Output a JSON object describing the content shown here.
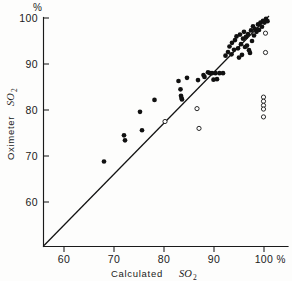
{
  "chart_data": {
    "type": "scatter",
    "title": "",
    "xlabel": "Calculated SO2",
    "xlabel_main": "Calculated",
    "xlabel_symbol": "SO",
    "xlabel_subscript": "2",
    "ylabel": "Oximeter SO2",
    "ylabel_main": "Oximeter",
    "ylabel_symbol": "SO",
    "ylabel_subscript": "2",
    "x_unit_label": "%",
    "y_unit_label": "%",
    "xlim": [
      55.8,
      102.5
    ],
    "ylim": [
      55.5,
      100.8
    ],
    "xticks": [
      60,
      70,
      80,
      90,
      100
    ],
    "xtick_labels": [
      "60",
      "70",
      "80",
      "90",
      "100"
    ],
    "yticks": [
      60,
      70,
      80,
      90,
      100
    ],
    "ytick_labels": [
      "60",
      "70",
      "80",
      "90",
      "100"
    ],
    "grid": false,
    "legend": false,
    "reference_line": {
      "name": "line-of-identity",
      "type": "identity",
      "from": [
        55.8,
        55.5
      ],
      "to": [
        101.0,
        100.4
      ]
    },
    "series": [
      {
        "name": "agreement-points",
        "marker": "filled-circle",
        "color": "#111111",
        "points": [
          [
            68.0,
            68.8
          ],
          [
            72.0,
            74.5
          ],
          [
            72.2,
            73.4
          ],
          [
            75.2,
            79.6
          ],
          [
            75.6,
            75.6
          ],
          [
            78.1,
            82.2
          ],
          [
            82.9,
            86.3
          ],
          [
            83.3,
            84.5
          ],
          [
            83.4,
            83.1
          ],
          [
            83.5,
            82.6
          ],
          [
            83.6,
            82.3
          ],
          [
            84.6,
            87.0
          ],
          [
            86.8,
            86.5
          ],
          [
            87.9,
            87.6
          ],
          [
            88.1,
            87.2
          ],
          [
            88.8,
            88.2
          ],
          [
            89.2,
            88.0
          ],
          [
            89.6,
            88.0
          ],
          [
            89.9,
            86.6
          ],
          [
            90.3,
            88.0
          ],
          [
            90.6,
            86.7
          ],
          [
            91.1,
            88.0
          ],
          [
            91.8,
            88.0
          ],
          [
            92.3,
            91.8
          ],
          [
            92.8,
            92.6
          ],
          [
            93.1,
            93.8
          ],
          [
            93.5,
            92.1
          ],
          [
            93.6,
            94.6
          ],
          [
            94.0,
            93.1
          ],
          [
            94.2,
            95.2
          ],
          [
            94.5,
            96.0
          ],
          [
            94.8,
            93.4
          ],
          [
            95.0,
            91.4
          ],
          [
            95.2,
            96.4
          ],
          [
            95.4,
            94.3
          ],
          [
            95.6,
            92.0
          ],
          [
            95.8,
            95.5
          ],
          [
            96.0,
            97.0
          ],
          [
            96.2,
            93.7
          ],
          [
            96.4,
            95.9
          ],
          [
            96.6,
            94.0
          ],
          [
            96.8,
            96.5
          ],
          [
            97.0,
            93.0
          ],
          [
            97.2,
            92.4
          ],
          [
            97.4,
            97.3
          ],
          [
            97.6,
            95.0
          ],
          [
            97.8,
            98.2
          ],
          [
            98.0,
            96.2
          ],
          [
            98.2,
            97.6
          ],
          [
            98.5,
            97.0
          ],
          [
            98.8,
            98.6
          ],
          [
            99.0,
            97.4
          ],
          [
            99.3,
            99.0
          ],
          [
            99.6,
            98.1
          ],
          [
            99.8,
            99.4
          ],
          [
            100.1,
            99.0
          ],
          [
            100.4,
            99.8
          ],
          [
            100.7,
            99.3
          ]
        ]
      },
      {
        "name": "outlier-points",
        "marker": "open-circle",
        "color": "#ffffff",
        "points": [
          [
            80.2,
            77.5
          ],
          [
            86.6,
            80.3
          ],
          [
            87.0,
            76.0
          ],
          [
            99.9,
            82.8
          ],
          [
            99.9,
            81.9
          ],
          [
            99.9,
            81.0
          ],
          [
            99.9,
            80.2
          ],
          [
            99.9,
            78.5
          ],
          [
            100.3,
            92.5
          ],
          [
            100.3,
            96.7
          ]
        ]
      }
    ]
  }
}
